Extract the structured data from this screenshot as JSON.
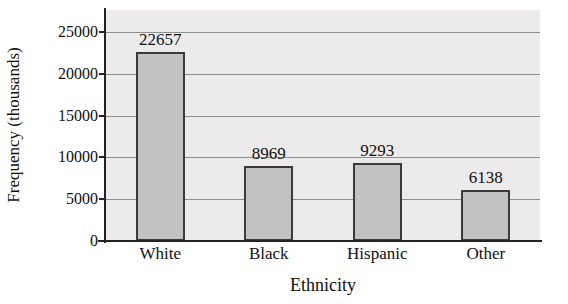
{
  "chart_data": {
    "type": "bar",
    "title": "",
    "subtitle": "",
    "xlabel": "Ethnicity",
    "ylabel": "Frequency (thousands)",
    "categories": [
      "White",
      "Black",
      "Hispanic",
      "Other"
    ],
    "values": [
      22657,
      8969,
      9293,
      6138
    ],
    "value_labels": [
      "22657",
      "8969",
      "9293",
      "6138"
    ],
    "ylim": [
      0,
      25000
    ],
    "ytick_values": [
      0,
      5000,
      10000,
      15000,
      20000,
      25000
    ],
    "ytick_labels": [
      "0",
      "5000",
      "10000",
      "15000",
      "20000",
      "25000"
    ],
    "grid": true,
    "grid_axis": "y",
    "legend": false,
    "legend_position": "none",
    "bar_fill_color": "#c2c2c2",
    "bar_border_color": "#3a3a3a",
    "plot_background_color": "#eceaea",
    "gridline_color": "#8d8d8d",
    "axis_color": "#222222",
    "text_color": "#111111"
  }
}
